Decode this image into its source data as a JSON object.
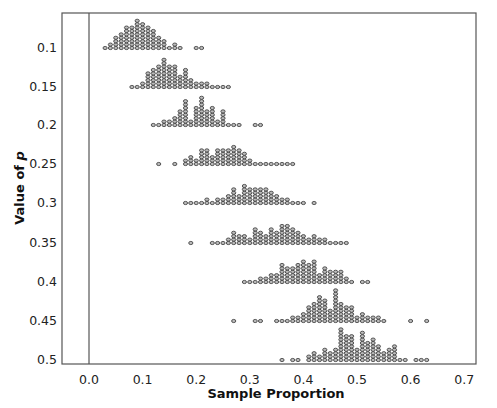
{
  "chart_data": {
    "type": "scatter",
    "subtype": "dotplot",
    "title": "",
    "xlabel": "Sample Proportion",
    "ylabel": "Value of p",
    "xlim": [
      -0.05,
      0.75
    ],
    "x_ticks": [
      "0.0",
      "0.1",
      "0.2",
      "0.3",
      "0.4",
      "0.5",
      "0.6",
      "0.7"
    ],
    "y_ticks": [
      "0.1",
      "0.15",
      "0.2",
      "0.25",
      "0.3",
      "0.35",
      "0.4",
      "0.45",
      "0.5"
    ],
    "grid": false,
    "reference_line_x": 0.0,
    "series": [
      {
        "name": "0.1",
        "points": [
          [
            0.03,
            1
          ],
          [
            0.04,
            2
          ],
          [
            0.05,
            4
          ],
          [
            0.06,
            5
          ],
          [
            0.07,
            7
          ],
          [
            0.08,
            7
          ],
          [
            0.09,
            9
          ],
          [
            0.1,
            8
          ],
          [
            0.11,
            7
          ],
          [
            0.12,
            6
          ],
          [
            0.13,
            4
          ],
          [
            0.14,
            3
          ],
          [
            0.15,
            1
          ],
          [
            0.16,
            2
          ],
          [
            0.17,
            1
          ],
          [
            0.2,
            1
          ],
          [
            0.21,
            1
          ]
        ]
      },
      {
        "name": "0.15",
        "points": [
          [
            0.08,
            1
          ],
          [
            0.09,
            1
          ],
          [
            0.1,
            2
          ],
          [
            0.11,
            5
          ],
          [
            0.12,
            6
          ],
          [
            0.13,
            7
          ],
          [
            0.14,
            9
          ],
          [
            0.15,
            7
          ],
          [
            0.16,
            7
          ],
          [
            0.17,
            4
          ],
          [
            0.18,
            6
          ],
          [
            0.19,
            3
          ],
          [
            0.2,
            2
          ],
          [
            0.21,
            2
          ],
          [
            0.22,
            2
          ],
          [
            0.23,
            1
          ],
          [
            0.24,
            1
          ],
          [
            0.25,
            1
          ],
          [
            0.26,
            1
          ]
        ]
      },
      {
        "name": "0.2",
        "points": [
          [
            0.12,
            1
          ],
          [
            0.13,
            1
          ],
          [
            0.14,
            2
          ],
          [
            0.15,
            2
          ],
          [
            0.16,
            3
          ],
          [
            0.17,
            5
          ],
          [
            0.18,
            8
          ],
          [
            0.19,
            2
          ],
          [
            0.2,
            6
          ],
          [
            0.21,
            9
          ],
          [
            0.22,
            5
          ],
          [
            0.23,
            6
          ],
          [
            0.24,
            2
          ],
          [
            0.25,
            5
          ],
          [
            0.26,
            1
          ],
          [
            0.27,
            1
          ],
          [
            0.28,
            1
          ],
          [
            0.31,
            1
          ],
          [
            0.32,
            1
          ]
        ]
      },
      {
        "name": "0.25",
        "points": [
          [
            0.13,
            1
          ],
          [
            0.16,
            1
          ],
          [
            0.18,
            2
          ],
          [
            0.19,
            3
          ],
          [
            0.2,
            2
          ],
          [
            0.21,
            5
          ],
          [
            0.22,
            5
          ],
          [
            0.23,
            3
          ],
          [
            0.24,
            5
          ],
          [
            0.25,
            5
          ],
          [
            0.26,
            5
          ],
          [
            0.27,
            6
          ],
          [
            0.28,
            5
          ],
          [
            0.29,
            4
          ],
          [
            0.3,
            2
          ],
          [
            0.31,
            1
          ],
          [
            0.32,
            1
          ],
          [
            0.33,
            1
          ],
          [
            0.34,
            1
          ],
          [
            0.35,
            1
          ],
          [
            0.36,
            1
          ],
          [
            0.37,
            1
          ],
          [
            0.38,
            1
          ]
        ]
      },
      {
        "name": "0.3",
        "points": [
          [
            0.18,
            1
          ],
          [
            0.19,
            1
          ],
          [
            0.2,
            1
          ],
          [
            0.21,
            1
          ],
          [
            0.22,
            2
          ],
          [
            0.23,
            1
          ],
          [
            0.24,
            2
          ],
          [
            0.25,
            2
          ],
          [
            0.26,
            3
          ],
          [
            0.27,
            5
          ],
          [
            0.28,
            3
          ],
          [
            0.29,
            6
          ],
          [
            0.3,
            5
          ],
          [
            0.31,
            5
          ],
          [
            0.32,
            5
          ],
          [
            0.33,
            5
          ],
          [
            0.34,
            4
          ],
          [
            0.35,
            3
          ],
          [
            0.36,
            2
          ],
          [
            0.37,
            2
          ],
          [
            0.38,
            1
          ],
          [
            0.39,
            1
          ],
          [
            0.4,
            1
          ],
          [
            0.42,
            1
          ]
        ]
      },
      {
        "name": "0.35",
        "points": [
          [
            0.19,
            1
          ],
          [
            0.23,
            1
          ],
          [
            0.24,
            1
          ],
          [
            0.25,
            1
          ],
          [
            0.26,
            2
          ],
          [
            0.27,
            4
          ],
          [
            0.28,
            3
          ],
          [
            0.29,
            3
          ],
          [
            0.3,
            2
          ],
          [
            0.31,
            5
          ],
          [
            0.32,
            4
          ],
          [
            0.33,
            3
          ],
          [
            0.34,
            5
          ],
          [
            0.35,
            4
          ],
          [
            0.36,
            6
          ],
          [
            0.37,
            6
          ],
          [
            0.38,
            5
          ],
          [
            0.39,
            4
          ],
          [
            0.4,
            3
          ],
          [
            0.41,
            2
          ],
          [
            0.42,
            3
          ],
          [
            0.43,
            2
          ],
          [
            0.44,
            2
          ],
          [
            0.45,
            1
          ],
          [
            0.46,
            1
          ],
          [
            0.47,
            1
          ],
          [
            0.48,
            1
          ]
        ]
      },
      {
        "name": "0.4",
        "points": [
          [
            0.29,
            1
          ],
          [
            0.3,
            1
          ],
          [
            0.31,
            1
          ],
          [
            0.32,
            2
          ],
          [
            0.33,
            2
          ],
          [
            0.34,
            3
          ],
          [
            0.35,
            3
          ],
          [
            0.36,
            6
          ],
          [
            0.37,
            5
          ],
          [
            0.38,
            5
          ],
          [
            0.39,
            6
          ],
          [
            0.4,
            7
          ],
          [
            0.41,
            6
          ],
          [
            0.42,
            7
          ],
          [
            0.43,
            3
          ],
          [
            0.44,
            5
          ],
          [
            0.45,
            4
          ],
          [
            0.46,
            4
          ],
          [
            0.47,
            4
          ],
          [
            0.48,
            2
          ],
          [
            0.49,
            1
          ],
          [
            0.51,
            1
          ],
          [
            0.52,
            1
          ]
        ]
      },
      {
        "name": "0.45",
        "points": [
          [
            0.27,
            1
          ],
          [
            0.31,
            1
          ],
          [
            0.32,
            1
          ],
          [
            0.35,
            1
          ],
          [
            0.36,
            1
          ],
          [
            0.37,
            1
          ],
          [
            0.38,
            2
          ],
          [
            0.39,
            2
          ],
          [
            0.4,
            3
          ],
          [
            0.41,
            5
          ],
          [
            0.42,
            6
          ],
          [
            0.43,
            8
          ],
          [
            0.44,
            7
          ],
          [
            0.45,
            4
          ],
          [
            0.46,
            10
          ],
          [
            0.47,
            6
          ],
          [
            0.48,
            5
          ],
          [
            0.49,
            5
          ],
          [
            0.5,
            2
          ],
          [
            0.51,
            3
          ],
          [
            0.52,
            2
          ],
          [
            0.53,
            2
          ],
          [
            0.54,
            2
          ],
          [
            0.55,
            1
          ],
          [
            0.6,
            1
          ],
          [
            0.63,
            1
          ]
        ]
      },
      {
        "name": "0.5",
        "points": [
          [
            0.36,
            1
          ],
          [
            0.38,
            1
          ],
          [
            0.39,
            1
          ],
          [
            0.41,
            2
          ],
          [
            0.42,
            3
          ],
          [
            0.43,
            2
          ],
          [
            0.44,
            4
          ],
          [
            0.45,
            3
          ],
          [
            0.46,
            4
          ],
          [
            0.47,
            10
          ],
          [
            0.48,
            8
          ],
          [
            0.49,
            8
          ],
          [
            0.5,
            4
          ],
          [
            0.51,
            9
          ],
          [
            0.52,
            6
          ],
          [
            0.53,
            7
          ],
          [
            0.54,
            5
          ],
          [
            0.55,
            3
          ],
          [
            0.56,
            4
          ],
          [
            0.57,
            5
          ],
          [
            0.58,
            1
          ],
          [
            0.59,
            1
          ],
          [
            0.61,
            1
          ],
          [
            0.62,
            1
          ],
          [
            0.63,
            1
          ]
        ]
      }
    ],
    "layout": {
      "plot_left": 62,
      "plot_right": 476,
      "plot_top": 13,
      "plot_bottom": 364,
      "x0_px": 89,
      "px_per_unit": 536,
      "row_baselines": [
        48,
        87,
        125,
        164,
        203,
        243,
        282,
        321,
        360
      ],
      "dot_pitch": 3.4,
      "colors": {
        "axis": "#555555",
        "dot_fill": "#bbbbbb",
        "dot_stroke": "#333333"
      }
    }
  }
}
